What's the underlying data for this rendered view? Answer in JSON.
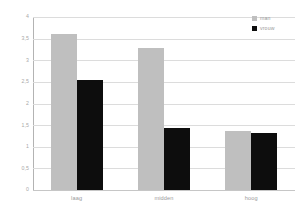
{
  "chart_data": {
    "type": "bar",
    "title": "",
    "xlabel": "",
    "ylabel": "",
    "categories": [
      "laag",
      "midden",
      "hoog"
    ],
    "series": [
      {
        "name": "man",
        "color": "#bfbfbf",
        "values": [
          3.6,
          3.28,
          1.36
        ]
      },
      {
        "name": "vrouw",
        "color": "#0d0d0d",
        "values": [
          2.54,
          1.43,
          1.32
        ]
      }
    ],
    "ylim": [
      0,
      4
    ],
    "ytick_values": [
      0,
      0.5,
      1,
      1.5,
      2,
      2.5,
      3,
      3.5,
      4
    ],
    "ytick_labels": [
      "0",
      "0,5",
      "1",
      "1,5",
      "2",
      "2,5",
      "3",
      "3,5",
      "4"
    ],
    "grid": true,
    "legend_position": "top-right"
  },
  "legend": {
    "entries": [
      {
        "label": "man"
      },
      {
        "label": "vrouw"
      }
    ]
  },
  "colors": {
    "series_man": "#bfbfbf",
    "series_vrouw": "#0d0d0d",
    "gridline": "#dcdcdc",
    "axis": "#b3b3b3",
    "tick_text": "#a8a8a8",
    "category_text": "#9a9a9a",
    "background": "#ffffff"
  }
}
